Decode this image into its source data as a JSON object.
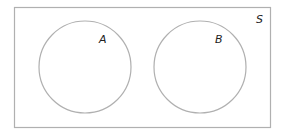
{
  "diagram": {
    "type": "venn",
    "universe": {
      "label": "S",
      "x": 14,
      "y": 7,
      "width": 256,
      "height": 120
    },
    "sets": [
      {
        "label": "A",
        "cx": 85,
        "cy": 67,
        "r": 46,
        "label_x": 104,
        "label_y": 43
      },
      {
        "label": "B",
        "cx": 200,
        "cy": 67,
        "r": 46,
        "label_x": 218,
        "label_y": 43
      }
    ],
    "colors": {
      "stroke": "#b0b0b0",
      "background": "#ffffff",
      "text": "#222222"
    }
  }
}
